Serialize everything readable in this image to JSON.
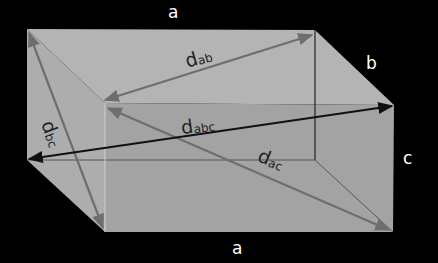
{
  "diagram": {
    "edge_labels": {
      "top_a": "a",
      "right_b": "b",
      "right_c": "c",
      "bottom_a": "a"
    },
    "diagonals": [
      {
        "id": "ab",
        "base": "d",
        "sub": "ab",
        "color": "#6e6e6e"
      },
      {
        "id": "bc",
        "base": "d",
        "sub": "bc",
        "color": "#6e6e6e"
      },
      {
        "id": "abc",
        "base": "d",
        "sub": "abc",
        "color": "#111111"
      },
      {
        "id": "ac",
        "base": "d",
        "sub": "ac",
        "color": "#6e6e6e"
      }
    ],
    "colors": {
      "background": "#000000",
      "top_face": "#b4b4b4",
      "left_face": "#adadad",
      "front_face": "#a3a3a3",
      "right_face": "#a9a9a9",
      "hidden_edge": "#555555"
    }
  }
}
